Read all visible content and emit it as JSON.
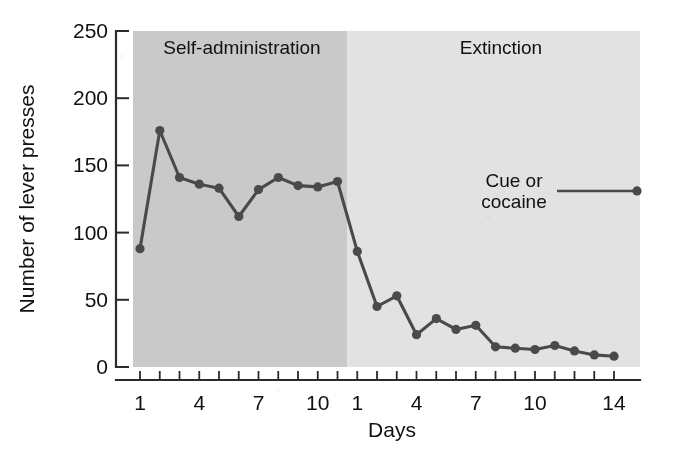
{
  "figure": {
    "caption_fragment": "",
    "phase_labels": {
      "self_administration": "Self-administration",
      "extinction": "Extinction"
    },
    "legend": {
      "line1": "Cue or",
      "line2": "cocaine"
    }
  },
  "chart_data": {
    "type": "line",
    "title": "",
    "xlabel": "Days",
    "ylabel": "Number of lever presses",
    "ylim": [
      0,
      250
    ],
    "yticks": [
      0,
      50,
      100,
      150,
      200,
      250
    ],
    "ytick_labels": [
      "0",
      "50",
      "100",
      "150",
      "200",
      "250"
    ],
    "grid": false,
    "legend_position": "upper-right-inside",
    "phases": [
      {
        "name": "Self-administration",
        "shade_color": "#c9c9c9",
        "x_axis_labels": [
          "1",
          "4",
          "7",
          "10"
        ],
        "x_label_days": [
          1,
          4,
          7,
          10
        ],
        "days": [
          1,
          2,
          3,
          4,
          5,
          6,
          7,
          8,
          9,
          10,
          11
        ],
        "values": [
          88,
          176,
          141,
          136,
          133,
          112,
          132,
          141,
          135,
          134,
          138
        ]
      },
      {
        "name": "Extinction",
        "shade_color": "#e2e2e2",
        "x_axis_labels": [
          "1",
          "4",
          "7",
          "10",
          "14"
        ],
        "x_label_days": [
          1,
          4,
          7,
          10,
          14
        ],
        "days": [
          1,
          2,
          3,
          4,
          5,
          6,
          7,
          8,
          9,
          10,
          11,
          12,
          13,
          14
        ],
        "values": [
          86,
          45,
          53,
          24,
          36,
          28,
          31,
          15,
          14,
          13,
          16,
          12,
          9,
          8
        ]
      }
    ],
    "annotation_point": {
      "label": "Cue or cocaine",
      "value": 131
    },
    "marker_color": "#4a4a4a",
    "line_color": "#4a4a4a"
  }
}
